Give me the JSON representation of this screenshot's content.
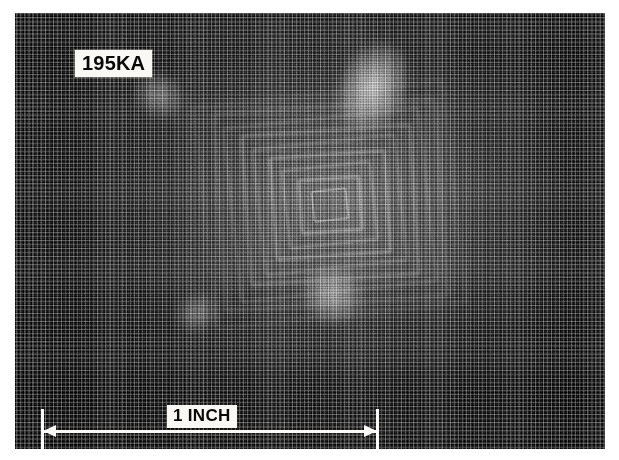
{
  "figure": {
    "kind": "photograph",
    "reproduction": "halftone-print",
    "plate": {
      "x": 15,
      "y": 13,
      "width": 590,
      "height": 436,
      "background_color": "#141414",
      "page_color": "#ffffff"
    }
  },
  "annotations": {
    "sample_label": {
      "text": "195KA",
      "box_color": "#f2f1ee",
      "text_color": "#101010"
    },
    "scale_bar": {
      "caption": "1 INCH",
      "length_value": 1,
      "length_unit": "INCH",
      "line_color": "#f4f3f0",
      "left_cap": "vertical-tick",
      "right_cap": "vertical-tick",
      "left_terminator": "arrowhead",
      "right_terminator": "arrowhead",
      "pixel_length": 338
    }
  },
  "image_content": {
    "mesh": {
      "description": "fine woven wire screen, orthogonal warp and weft",
      "pitch_px": 4,
      "tone": "dark"
    },
    "feature": {
      "description": "concentric square moire fringes from a pyramidal indentation",
      "center_x": 330,
      "center_y": 205,
      "ring_count": 9,
      "rotation_deg": -5,
      "highlights": [
        "upper-right specular flare",
        "lower-right specular flare"
      ]
    },
    "tone_map": {
      "darkest": "#0d0d0d",
      "midtone": "#5a5a5a",
      "brightest": "#e8e8e8"
    }
  }
}
